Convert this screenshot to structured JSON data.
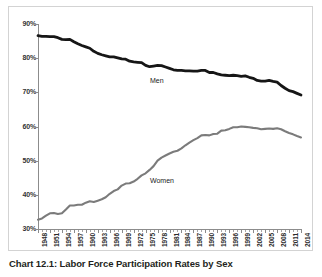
{
  "caption": "Chart 12.1: Labor Force Participation Rates by Sex",
  "labels": {
    "men": "Men",
    "women": "Women"
  },
  "colors": {
    "men_line": "#161616",
    "women_line": "#7b7b7b",
    "axis": "#8c8c8c",
    "frame": "#d3d3d3",
    "text": "#231f20",
    "background": "#ffffff"
  },
  "chart_data": {
    "type": "line",
    "title": "Chart 12.1: Labor Force Participation Rates by Sex",
    "xlabel": "",
    "ylabel": "",
    "ylim": [
      30,
      90
    ],
    "xlim": [
      1948,
      2014
    ],
    "ytick_labels": [
      "90%",
      "80%",
      "70%",
      "60%",
      "50%",
      "40%",
      "30%"
    ],
    "ytick_values": [
      90,
      80,
      70,
      60,
      50,
      40,
      30
    ],
    "grid": false,
    "legend": "inline-annotations",
    "xtick_labels": [
      "1948",
      "1951",
      "1954",
      "1957",
      "1960",
      "1963",
      "1966",
      "1969",
      "1972",
      "1975",
      "1978",
      "1981",
      "1984",
      "1987",
      "1990",
      "1993",
      "1996",
      "1999",
      "2002",
      "2005",
      "2008",
      "2011",
      "2014"
    ],
    "x": [
      1948,
      1949,
      1950,
      1951,
      1952,
      1953,
      1954,
      1955,
      1956,
      1957,
      1958,
      1959,
      1960,
      1961,
      1962,
      1963,
      1964,
      1965,
      1966,
      1967,
      1968,
      1969,
      1970,
      1971,
      1972,
      1973,
      1974,
      1975,
      1976,
      1977,
      1978,
      1979,
      1980,
      1981,
      1982,
      1983,
      1984,
      1985,
      1986,
      1987,
      1988,
      1989,
      1990,
      1991,
      1992,
      1993,
      1994,
      1995,
      1996,
      1997,
      1998,
      1999,
      2000,
      2001,
      2002,
      2003,
      2004,
      2005,
      2006,
      2007,
      2008,
      2009,
      2010,
      2011,
      2012,
      2013,
      2014
    ],
    "series": [
      {
        "name": "Men",
        "color": "#161616",
        "values": [
          86.6,
          86.4,
          86.4,
          86.3,
          86.3,
          86.0,
          85.5,
          85.4,
          85.5,
          84.8,
          84.2,
          83.7,
          83.3,
          82.9,
          82.0,
          81.4,
          81.0,
          80.7,
          80.4,
          80.4,
          80.1,
          79.8,
          79.7,
          79.1,
          78.9,
          78.8,
          78.7,
          77.9,
          77.5,
          77.7,
          77.9,
          77.8,
          77.4,
          77.0,
          76.6,
          76.4,
          76.4,
          76.3,
          76.3,
          76.2,
          76.2,
          76.4,
          76.4,
          75.8,
          75.8,
          75.4,
          75.1,
          75.0,
          74.9,
          75.0,
          74.9,
          74.7,
          74.8,
          74.4,
          74.1,
          73.5,
          73.3,
          73.3,
          73.5,
          73.2,
          73.0,
          72.0,
          71.2,
          70.5,
          70.2,
          69.7,
          69.2
        ]
      },
      {
        "name": "Women",
        "color": "#7b7b7b",
        "values": [
          32.7,
          33.1,
          33.9,
          34.6,
          34.7,
          34.4,
          34.6,
          35.7,
          36.9,
          36.9,
          37.1,
          37.1,
          37.7,
          38.1,
          37.9,
          38.3,
          38.7,
          39.3,
          40.3,
          41.1,
          41.6,
          42.7,
          43.3,
          43.4,
          43.9,
          44.7,
          45.7,
          46.3,
          47.3,
          48.4,
          50.0,
          50.9,
          51.5,
          52.1,
          52.6,
          52.9,
          53.6,
          54.5,
          55.3,
          56.0,
          56.6,
          57.4,
          57.5,
          57.4,
          57.8,
          57.9,
          58.8,
          58.9,
          59.3,
          59.8,
          59.8,
          60.0,
          59.9,
          59.8,
          59.6,
          59.5,
          59.2,
          59.3,
          59.4,
          59.3,
          59.5,
          59.2,
          58.6,
          58.1,
          57.7,
          57.2,
          56.8
        ]
      }
    ]
  }
}
